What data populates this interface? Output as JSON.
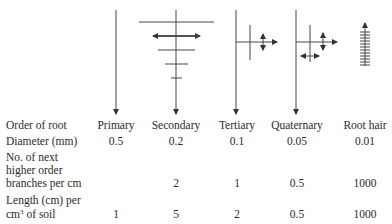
{
  "diagram": {
    "root_orders": [
      "Primary",
      "Secondary",
      "Tertiary",
      "Quaternary",
      "Root hair"
    ]
  },
  "table": {
    "rows": [
      {
        "label": "Order of root",
        "values": [
          "Primary",
          "Secondary",
          "Tertiary",
          "Quaternary",
          "Root hair"
        ]
      },
      {
        "label": "Diameter (mm)",
        "values": [
          "0.5",
          "0.2",
          "0.1",
          "0.05",
          "0.01"
        ]
      },
      {
        "label_lines": [
          "No. of next",
          "higher order",
          "branches per cm"
        ],
        "values": [
          "",
          "2",
          "1",
          "0.5",
          "1000"
        ]
      },
      {
        "label_lines": [
          "Length (cm) per",
          "cm",
          " of soil"
        ],
        "label_sup": "3",
        "values": [
          "1",
          "5",
          "2",
          "0.5",
          "1000"
        ]
      }
    ]
  }
}
